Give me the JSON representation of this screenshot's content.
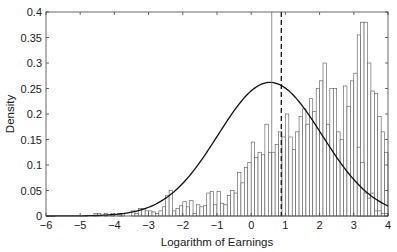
{
  "chart_data": {
    "type": "bar",
    "title": "",
    "xlabel": "Logarithm of Earnings",
    "ylabel": "Density",
    "xlim": [
      -6,
      4
    ],
    "ylim": [
      0,
      0.4
    ],
    "grid": false,
    "legend": null,
    "xticks": [
      -6,
      -5,
      -4,
      -3,
      -2,
      -1,
      0,
      1,
      2,
      3,
      4
    ],
    "xtick_labels": [
      "−6",
      "−5",
      "−4",
      "−3",
      "−2",
      "−1",
      "0",
      "1",
      "2",
      "3",
      "4"
    ],
    "yticks": [
      0,
      0.05,
      0.1,
      0.15,
      0.2,
      0.25,
      0.3,
      0.35,
      0.4
    ],
    "ytick_labels": [
      "0",
      "0.05",
      "0.1",
      "0.15",
      "0.2",
      "0.25",
      "0.3",
      "0.35",
      "0.4"
    ],
    "histogram": {
      "bin_start": -6,
      "bin_width": 0.1,
      "densities": [
        0,
        0,
        0,
        0,
        0,
        0,
        0,
        0,
        0,
        0,
        0,
        0,
        0,
        0,
        0.005,
        0.005,
        0,
        0.005,
        0,
        0.005,
        0,
        0.005,
        0.005,
        0,
        0,
        0.01,
        0.005,
        0.015,
        0.015,
        0.01,
        0.01,
        0.008,
        0.005,
        0.01,
        0.018,
        0.04,
        0.05,
        0.01,
        0.015,
        0.02,
        0.028,
        0.018,
        0.03,
        0.005,
        0.022,
        0.018,
        0.02,
        0.045,
        0.048,
        0.022,
        0.048,
        0.025,
        0.022,
        0.04,
        0.05,
        0.045,
        0.085,
        0.065,
        0.095,
        0.105,
        0.145,
        0.115,
        0.125,
        0.12,
        0.18,
        0.125,
        0.125,
        0.14,
        0.165,
        0.155,
        0.2,
        0.155,
        0.13,
        0.165,
        0.195,
        0.21,
        0.18,
        0.23,
        0.205,
        0.25,
        0.265,
        0.3,
        0.18,
        0.25,
        0.25,
        0.165,
        0.15,
        0.255,
        0.215,
        0.265,
        0.28,
        0.355,
        0.38,
        0.38,
        0.3,
        0.245,
        0.24,
        0.195,
        0.165,
        0.125
      ],
      "tail_bins": [
        {
          "x": 3.1,
          "density": 0.135
        },
        {
          "x": 3.2,
          "density": 0.105
        },
        {
          "x": 3.3,
          "density": 0.045
        },
        {
          "x": 3.4,
          "density": 0.035
        },
        {
          "x": 3.5,
          "density": 0.045
        },
        {
          "x": 3.6,
          "density": 0.01
        },
        {
          "x": 3.7,
          "density": 0.01
        },
        {
          "x": 3.8,
          "density": 0.005
        },
        {
          "x": 3.9,
          "density": 0.005
        }
      ]
    },
    "normal_fit": {
      "mean": 0.55,
      "std": 1.52,
      "peak_density": 0.262
    },
    "reference_lines": [
      {
        "x": 0.6,
        "style": "solid",
        "label": ""
      },
      {
        "x": 0.88,
        "style": "dashed",
        "label": ""
      }
    ]
  }
}
